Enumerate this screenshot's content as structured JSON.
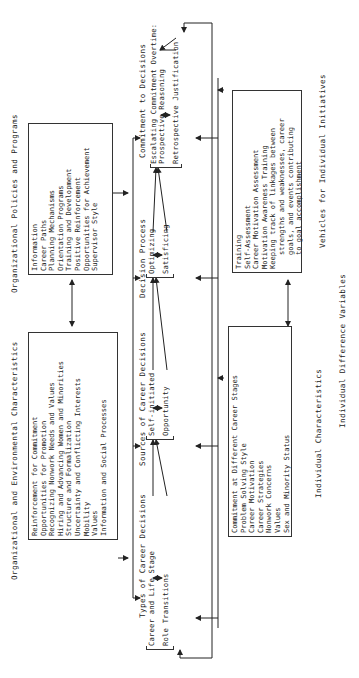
{
  "diagram": {
    "orientation": "rotated 90 degrees counter-clockwise",
    "org_env": {
      "title": "Organizational and Environmental Characteristics",
      "items": [
        "Reinforcement for Commitment",
        "Opportunities for Promotion",
        "Recognizing Nonwork Needs and Values",
        "Hiring and Advancing Women and Minorities",
        "Structure and Formalization",
        "Uncertainty and Conflicting Interests",
        "Mobility",
        "Values",
        "Information and Social Processes"
      ]
    },
    "org_policies": {
      "title": "Organizational Policies and Programs",
      "items": [
        "Information",
        "Career Paths",
        "Planning Mechanisms",
        "Orientation Programs",
        "Training and Development",
        "Positive Reinforcement",
        "Opportunities for Achievement",
        "Supervisor Style"
      ]
    },
    "types": {
      "title": "Types of Career Decisions",
      "items": [
        "Career and Life Stage",
        "Role Transitions"
      ]
    },
    "sources": {
      "title": "Sources of Career Decisions",
      "items": [
        "Self-initiated",
        "Opportunity"
      ]
    },
    "process": {
      "title": "Decision Process",
      "items": [
        "Optimizing",
        "Satisficing"
      ]
    },
    "commitment": {
      "title": "Commitment to Decisions",
      "items": [
        "Escalating Commitment Overtime:",
        "Prospective Reasoning",
        "Retrospective Justification"
      ]
    },
    "individual": {
      "title": "Individual Characteristics",
      "items": [
        "Commitment at Different Career Stages",
        "Problem Solving Style",
        "Career Motivation",
        "Career Strategies",
        "Nonwork Concerns",
        "Values",
        "Sex and Minority Status"
      ]
    },
    "vehicles": {
      "title": "Vehicles for Individual Initiatives",
      "items": [
        "Training",
        "Self-Assessment",
        "Career Motivation Assessment",
        "Motivation Awareness Training",
        "Keeping track of linkages between",
        "strengths and weaknesses, career",
        "goals, and events contributing",
        "to goal accomplishment"
      ]
    },
    "footer": "Individual Difference Variables"
  }
}
